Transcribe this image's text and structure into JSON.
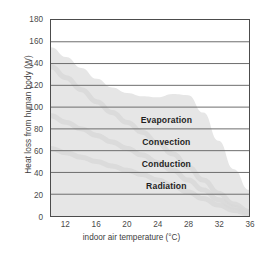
{
  "chart_data": {
    "type": "area",
    "title": "",
    "xlabel": "indoor air temperature (°C)",
    "ylabel": "Heat loss from human body (W)",
    "xlim": [
      10,
      36
    ],
    "ylim": [
      0,
      180
    ],
    "xticks": [
      12,
      16,
      20,
      24,
      28,
      32,
      36
    ],
    "yticks": [
      0,
      20,
      40,
      60,
      80,
      100,
      120,
      140,
      160,
      180
    ],
    "grid": true,
    "grid_orientation": "horizontal",
    "legend": "inline-band-labels",
    "stacked": true,
    "x": [
      10,
      12,
      14,
      16,
      18,
      20,
      22,
      24,
      26,
      28,
      30,
      32,
      34,
      36
    ],
    "series": [
      {
        "name": "Radiation",
        "values": [
          62,
          58,
          54,
          50,
          46,
          42,
          38,
          33,
          28,
          22,
          16,
          10,
          5,
          2
        ]
      },
      {
        "name": "Conduction",
        "values": [
          30,
          28,
          26,
          24,
          22,
          20,
          18,
          16,
          14,
          11,
          8,
          5,
          3,
          1
        ]
      },
      {
        "name": "Convection",
        "values": [
          45,
          41,
          36,
          31,
          27,
          24,
          21,
          18,
          15,
          12,
          9,
          6,
          3,
          1
        ]
      },
      {
        "name": "Evaporation",
        "values": [
          18,
          19,
          20,
          21,
          23,
          27,
          33,
          42,
          55,
          66,
          62,
          48,
          32,
          20
        ]
      }
    ],
    "total_curve": {
      "name": "Total heat loss",
      "values": [
        155,
        146,
        136,
        126,
        118,
        113,
        110,
        109,
        112,
        111,
        95,
        69,
        43,
        24
      ]
    },
    "band_labels": [
      {
        "text": "Evaporation",
        "x": 25.0,
        "y": 89
      },
      {
        "text": "Convection",
        "x": 25.0,
        "y": 69
      },
      {
        "text": "Conduction",
        "x": 25.0,
        "y": 49
      },
      {
        "text": "Radiation",
        "x": 25.0,
        "y": 29
      }
    ],
    "colors": {
      "area_fill": "#e6e6e6",
      "area_fill_dark": "#d8d8d8",
      "gridline": "#6e6e6e",
      "gridline_light": "#b9b9b9",
      "frame": "#4c4c4c",
      "text": "#3d3d3d",
      "label_text": "#1f1f1f",
      "background": "#ffffff"
    }
  }
}
